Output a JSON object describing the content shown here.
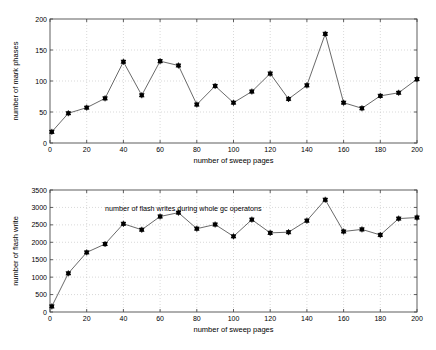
{
  "figure": {
    "background": "#ffffff",
    "line_color": "#595959",
    "marker_color": "#000000",
    "axis_color": "#4d4d4d",
    "grid_color": "#bfbfbf",
    "width": 436,
    "height": 350
  },
  "chart_data": [
    {
      "type": "line",
      "id": "mark-phases-chart",
      "title": "",
      "xlabel": "number of sweep pages",
      "ylabel": "number of mark phases",
      "xlim": [
        0,
        200
      ],
      "ylim": [
        0,
        200
      ],
      "xticks": [
        0,
        20,
        40,
        60,
        80,
        100,
        120,
        140,
        160,
        180,
        200
      ],
      "xticklabels": [
        "0",
        "20",
        "40",
        "60",
        "80",
        "100",
        "120",
        "140",
        "160",
        "180",
        "200"
      ],
      "yticks": [
        0,
        50,
        100,
        150,
        200
      ],
      "yticklabels": [
        "0",
        "50",
        "100",
        "150",
        "200"
      ],
      "grid": true,
      "legend": "none",
      "marker": "star-square",
      "x": [
        1,
        10,
        20,
        30,
        40,
        50,
        60,
        70,
        80,
        90,
        100,
        110,
        120,
        130,
        140,
        150,
        160,
        170,
        180,
        190,
        200
      ],
      "values": [
        18,
        48,
        57,
        72,
        131,
        77,
        132,
        125,
        62,
        92,
        65,
        83,
        112,
        71,
        93,
        176,
        65,
        56,
        76,
        81,
        103
      ],
      "annotations": []
    },
    {
      "type": "line",
      "id": "flash-writes-chart",
      "title": "",
      "xlabel": "number of sweep pages",
      "ylabel": "number of flash write",
      "xlim": [
        0,
        200
      ],
      "ylim": [
        0,
        3500
      ],
      "xticks": [
        0,
        20,
        40,
        60,
        80,
        100,
        120,
        140,
        160,
        180,
        200
      ],
      "xticklabels": [
        "0",
        "20",
        "40",
        "60",
        "80",
        "100",
        "120",
        "140",
        "160",
        "180",
        "200"
      ],
      "yticks": [
        0,
        500,
        1000,
        1500,
        2000,
        2500,
        3000,
        3500
      ],
      "yticklabels": [
        "0",
        "500",
        "1000",
        "1500",
        "2000",
        "2500",
        "3000",
        "3500"
      ],
      "grid": true,
      "legend": "none",
      "marker": "star-square",
      "x": [
        1,
        10,
        20,
        30,
        40,
        50,
        60,
        70,
        80,
        90,
        100,
        110,
        120,
        130,
        140,
        150,
        160,
        170,
        180,
        190,
        200
      ],
      "values": [
        160,
        1110,
        1710,
        1950,
        2530,
        2360,
        2740,
        2850,
        2390,
        2510,
        2170,
        2650,
        2270,
        2290,
        2620,
        3220,
        2310,
        2370,
        2210,
        2680,
        2710
      ],
      "annotations": [
        {
          "text": "number of flash writes during whole gc operatons",
          "x": 30,
          "y": 2900
        }
      ]
    }
  ]
}
